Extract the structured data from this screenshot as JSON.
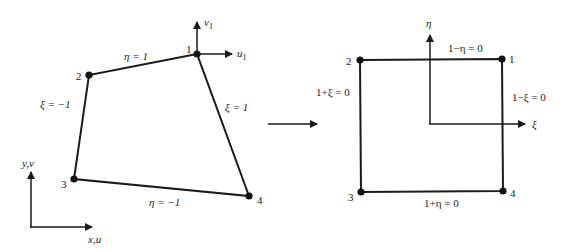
{
  "physical_element": {
    "nodes": [
      {
        "id": "1",
        "label": "1"
      },
      {
        "id": "2",
        "label": "2"
      },
      {
        "id": "3",
        "label": "3"
      },
      {
        "id": "4",
        "label": "4"
      }
    ],
    "edges": {
      "top": "η = 1",
      "left": "ξ = −1",
      "right": "ξ = 1",
      "bottom": "η = −1"
    },
    "node1_dofs": {
      "v": "v",
      "v_sub": "1",
      "u": "u",
      "u_sub": "1"
    },
    "global_axes": {
      "y": "y,v",
      "x": "x,u"
    }
  },
  "mapping_arrow": {
    "label": ""
  },
  "natural_element": {
    "nodes": [
      {
        "id": "1",
        "label": "1"
      },
      {
        "id": "2",
        "label": "2"
      },
      {
        "id": "3",
        "label": "3"
      },
      {
        "id": "4",
        "label": "4"
      }
    ],
    "edges": {
      "top": "1−η = 0",
      "left": "1+ξ = 0",
      "right": "1−ξ = 0",
      "bottom": "1+η = 0"
    },
    "axes": {
      "eta": "η",
      "xi": "ξ"
    }
  }
}
